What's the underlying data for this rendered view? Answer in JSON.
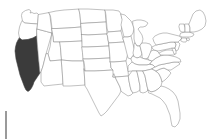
{
  "map": {
    "title": "United States state map",
    "type": "choropleth-outline",
    "projection": "albers-usa",
    "background_color": "#ffffff",
    "border_color": "#8e8e8e",
    "default_fill": "#ffffff",
    "highlight_fill": "#3b3b3b",
    "highlighted_states": [
      "California"
    ],
    "states": [
      {
        "code": "WA",
        "name": "Washington",
        "highlighted": false
      },
      {
        "code": "OR",
        "name": "Oregon",
        "highlighted": false
      },
      {
        "code": "CA",
        "name": "California",
        "highlighted": true
      },
      {
        "code": "NV",
        "name": "Nevada",
        "highlighted": false
      },
      {
        "code": "ID",
        "name": "Idaho",
        "highlighted": false
      },
      {
        "code": "MT",
        "name": "Montana",
        "highlighted": false
      },
      {
        "code": "WY",
        "name": "Wyoming",
        "highlighted": false
      },
      {
        "code": "UT",
        "name": "Utah",
        "highlighted": false
      },
      {
        "code": "AZ",
        "name": "Arizona",
        "highlighted": false
      },
      {
        "code": "CO",
        "name": "Colorado",
        "highlighted": false
      },
      {
        "code": "NM",
        "name": "New Mexico",
        "highlighted": false
      },
      {
        "code": "ND",
        "name": "North Dakota",
        "highlighted": false
      },
      {
        "code": "SD",
        "name": "South Dakota",
        "highlighted": false
      },
      {
        "code": "NE",
        "name": "Nebraska",
        "highlighted": false
      },
      {
        "code": "KS",
        "name": "Kansas",
        "highlighted": false
      },
      {
        "code": "OK",
        "name": "Oklahoma",
        "highlighted": false
      },
      {
        "code": "TX",
        "name": "Texas",
        "highlighted": false
      },
      {
        "code": "MN",
        "name": "Minnesota",
        "highlighted": false
      },
      {
        "code": "IA",
        "name": "Iowa",
        "highlighted": false
      },
      {
        "code": "MO",
        "name": "Missouri",
        "highlighted": false
      },
      {
        "code": "AR",
        "name": "Arkansas",
        "highlighted": false
      },
      {
        "code": "LA",
        "name": "Louisiana",
        "highlighted": false
      },
      {
        "code": "WI",
        "name": "Wisconsin",
        "highlighted": false
      },
      {
        "code": "IL",
        "name": "Illinois",
        "highlighted": false
      },
      {
        "code": "MI",
        "name": "Michigan",
        "highlighted": false
      },
      {
        "code": "IN",
        "name": "Indiana",
        "highlighted": false
      },
      {
        "code": "OH",
        "name": "Ohio",
        "highlighted": false
      },
      {
        "code": "KY",
        "name": "Kentucky",
        "highlighted": false
      },
      {
        "code": "TN",
        "name": "Tennessee",
        "highlighted": false
      },
      {
        "code": "MS",
        "name": "Mississippi",
        "highlighted": false
      },
      {
        "code": "AL",
        "name": "Alabama",
        "highlighted": false
      },
      {
        "code": "GA",
        "name": "Georgia",
        "highlighted": false
      },
      {
        "code": "FL",
        "name": "Florida",
        "highlighted": false
      },
      {
        "code": "SC",
        "name": "South Carolina",
        "highlighted": false
      },
      {
        "code": "NC",
        "name": "North Carolina",
        "highlighted": false
      },
      {
        "code": "VA",
        "name": "Virginia",
        "highlighted": false
      },
      {
        "code": "WV",
        "name": "West Virginia",
        "highlighted": false
      },
      {
        "code": "MD",
        "name": "Maryland",
        "highlighted": false
      },
      {
        "code": "DE",
        "name": "Delaware",
        "highlighted": false
      },
      {
        "code": "PA",
        "name": "Pennsylvania",
        "highlighted": false
      },
      {
        "code": "NJ",
        "name": "New Jersey",
        "highlighted": false
      },
      {
        "code": "NY",
        "name": "New York",
        "highlighted": false
      },
      {
        "code": "CT",
        "name": "Connecticut",
        "highlighted": false
      },
      {
        "code": "RI",
        "name": "Rhode Island",
        "highlighted": false
      },
      {
        "code": "MA",
        "name": "Massachusetts",
        "highlighted": false
      },
      {
        "code": "VT",
        "name": "Vermont",
        "highlighted": false
      },
      {
        "code": "NH",
        "name": "New Hampshire",
        "highlighted": false
      },
      {
        "code": "ME",
        "name": "Maine",
        "highlighted": false
      }
    ]
  },
  "scale_bar": {
    "label": "",
    "color": "#9a9a9a",
    "orientation": "vertical",
    "x": 5,
    "y": 111,
    "width": 2,
    "height": 28
  }
}
